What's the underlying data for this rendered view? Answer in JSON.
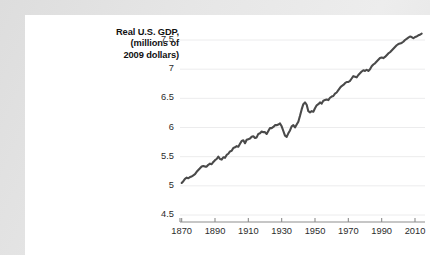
{
  "figure": {
    "background_color": "#e6e6e6",
    "card_color": "#ffffff",
    "line_color": "#4a4a4a",
    "grid_color": "#ececed",
    "axis_color": "#8d8d8d",
    "text_color": "#2b2b2b"
  },
  "title_lines": [
    "Real U.S. GDP,",
    "(millions of",
    "2009 dollars)"
  ],
  "chart_data": {
    "type": "line",
    "title": "Real U.S. GDP, (millions of 2009 dollars)",
    "xlabel": "",
    "ylabel": "Real U.S. GDP, (millions of 2009 dollars)",
    "xlim": [
      1869,
      2016
    ],
    "ylim": [
      4.5,
      7.5
    ],
    "xticks": [
      1870,
      1890,
      1910,
      1930,
      1950,
      1970,
      1990,
      2010
    ],
    "xtick_labels": [
      "1870",
      "1890",
      "1910",
      "1930",
      "1950",
      "1970",
      "1990",
      "2010"
    ],
    "yticks": [
      4.5,
      5,
      5.5,
      6,
      6.5,
      7,
      7.5
    ],
    "ytick_labels": [
      "4.5",
      "5",
      "5.5",
      "6",
      "6.5",
      "7",
      "7.5"
    ],
    "grid": true,
    "grid_axis": "y",
    "legend": false,
    "legend_position": "none",
    "note": "Natural log of real U.S. GDP; values are log scale readings off the y-axis.",
    "series": [
      {
        "name": "Real U.S. GDP (log, millions of 2009 dollars)",
        "x": [
          1870,
          1871,
          1872,
          1873,
          1874,
          1875,
          1876,
          1877,
          1878,
          1879,
          1880,
          1881,
          1882,
          1883,
          1884,
          1885,
          1886,
          1887,
          1888,
          1889,
          1890,
          1891,
          1892,
          1893,
          1894,
          1895,
          1896,
          1897,
          1898,
          1899,
          1900,
          1901,
          1902,
          1903,
          1904,
          1905,
          1906,
          1907,
          1908,
          1909,
          1910,
          1911,
          1912,
          1913,
          1914,
          1915,
          1916,
          1917,
          1918,
          1919,
          1920,
          1921,
          1922,
          1923,
          1924,
          1925,
          1926,
          1927,
          1928,
          1929,
          1930,
          1931,
          1932,
          1933,
          1934,
          1935,
          1936,
          1937,
          1938,
          1939,
          1940,
          1941,
          1942,
          1943,
          1944,
          1945,
          1946,
          1947,
          1948,
          1949,
          1950,
          1951,
          1952,
          1953,
          1954,
          1955,
          1956,
          1957,
          1958,
          1959,
          1960,
          1961,
          1962,
          1963,
          1964,
          1965,
          1966,
          1967,
          1968,
          1969,
          1970,
          1971,
          1972,
          1973,
          1974,
          1975,
          1976,
          1977,
          1978,
          1979,
          1980,
          1981,
          1982,
          1983,
          1984,
          1985,
          1986,
          1987,
          1988,
          1989,
          1990,
          1991,
          1992,
          1993,
          1994,
          1995,
          1996,
          1997,
          1998,
          1999,
          2000,
          2001,
          2002,
          2003,
          2004,
          2005,
          2006,
          2007,
          2008,
          2009,
          2010,
          2011,
          2012,
          2013,
          2014
        ],
        "values": [
          5.05,
          5.08,
          5.13,
          5.15,
          5.14,
          5.16,
          5.17,
          5.19,
          5.21,
          5.26,
          5.31,
          5.33,
          5.37,
          5.38,
          5.38,
          5.37,
          5.4,
          5.42,
          5.41,
          5.46,
          5.49,
          5.51,
          5.56,
          5.52,
          5.5,
          5.56,
          5.55,
          5.6,
          5.62,
          5.67,
          5.68,
          5.74,
          5.75,
          5.78,
          5.77,
          5.82,
          5.88,
          5.89,
          5.84,
          5.91,
          5.92,
          5.93,
          5.97,
          5.98,
          5.95,
          5.96,
          6.03,
          6.05,
          6.09,
          6.08,
          6.08,
          6.05,
          6.11,
          6.19,
          6.2,
          6.23,
          6.27,
          6.28,
          6.29,
          6.33,
          6.26,
          6.17,
          6.08,
          6.06,
          6.14,
          6.2,
          6.29,
          6.32,
          6.28,
          6.34,
          6.41,
          6.54,
          6.68,
          6.8,
          6.84,
          6.8,
          6.66,
          6.64,
          6.67,
          6.66,
          6.74,
          6.81,
          6.84,
          6.88,
          6.86,
          6.92,
          6.94,
          6.95,
          6.94,
          7.0,
          7.02,
          7.04,
          7.09,
          7.12,
          7.17,
          7.22,
          7.27,
          7.29,
          7.33,
          7.36,
          7.36,
          7.39,
          7.44,
          7.49,
          7.48,
          7.47,
          7.52,
          7.56,
          7.61,
          7.64,
          7.63,
          7.65,
          7.63,
          7.67,
          7.74,
          7.78,
          7.81,
          7.85,
          7.89,
          7.93,
          7.94,
          7.93,
          7.97,
          8.0,
          8.04,
          8.07,
          8.11,
          8.15,
          8.19,
          8.24,
          8.27,
          8.28,
          8.3,
          8.33,
          8.37,
          8.4,
          8.43,
          8.45,
          8.44,
          8.41,
          8.44,
          8.46,
          8.48,
          8.5,
          8.53
        ]
      }
    ],
    "display_values": [
      5.05,
      5.08,
      5.12,
      5.14,
      5.13,
      5.15,
      5.16,
      5.18,
      5.2,
      5.24,
      5.27,
      5.3,
      5.33,
      5.34,
      5.33,
      5.33,
      5.36,
      5.38,
      5.37,
      5.41,
      5.44,
      5.46,
      5.5,
      5.46,
      5.45,
      5.49,
      5.48,
      5.53,
      5.55,
      5.59,
      5.6,
      5.65,
      5.66,
      5.68,
      5.67,
      5.72,
      5.77,
      5.78,
      5.73,
      5.79,
      5.8,
      5.81,
      5.84,
      5.85,
      5.82,
      5.83,
      5.89,
      5.9,
      5.93,
      5.92,
      5.92,
      5.89,
      5.94,
      5.99,
      5.99,
      6.01,
      6.04,
      6.04,
      6.05,
      6.07,
      6.02,
      5.94,
      5.86,
      5.84,
      5.9,
      5.95,
      6.02,
      6.04,
      6.0,
      6.05,
      6.1,
      6.2,
      6.31,
      6.4,
      6.43,
      6.39,
      6.28,
      6.26,
      6.28,
      6.27,
      6.33,
      6.38,
      6.4,
      6.43,
      6.41,
      6.46,
      6.47,
      6.48,
      6.47,
      6.51,
      6.53,
      6.54,
      6.58,
      6.6,
      6.64,
      6.68,
      6.71,
      6.73,
      6.76,
      6.78,
      6.78,
      6.8,
      6.84,
      6.88,
      6.87,
      6.86,
      6.9,
      6.93,
      6.96,
      6.98,
      6.97,
      6.99,
      6.97,
      7.0,
      7.05,
      7.08,
      7.1,
      7.13,
      7.16,
      7.19,
      7.2,
      7.19,
      7.21,
      7.24,
      7.27,
      7.29,
      7.32,
      7.35,
      7.38,
      7.41,
      7.43,
      7.44,
      7.45,
      7.47,
      7.5,
      7.52,
      7.54,
      7.56,
      7.55,
      7.53,
      7.55,
      7.56,
      7.58,
      7.59,
      7.61
    ]
  }
}
